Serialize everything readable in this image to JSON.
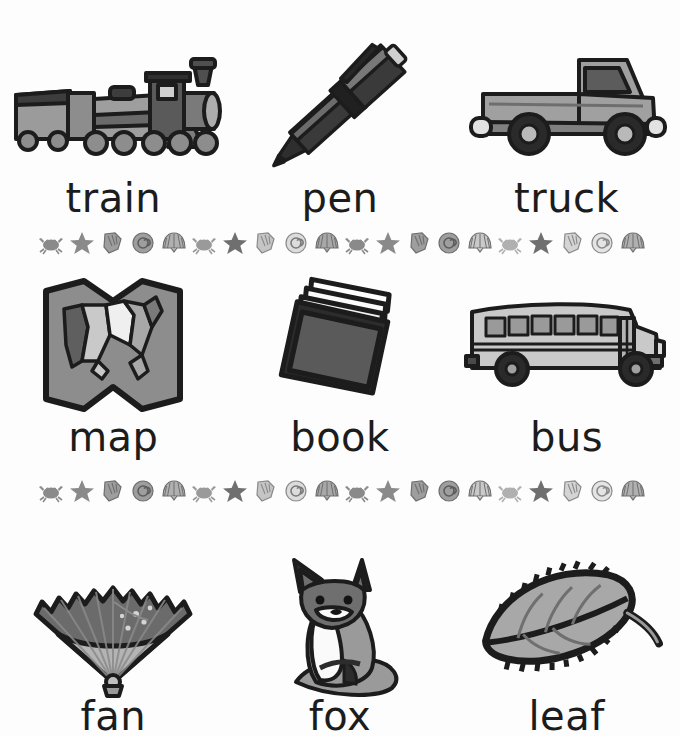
{
  "page": {
    "background_color": "#fdfdfd",
    "text_color": "#1c1c1c",
    "width": 680,
    "height": 736
  },
  "palette": {
    "ink": "#1c1c1c",
    "dark_gray": "#4a4a4a",
    "mid_gray": "#7d7d7d",
    "light_gray": "#b4b4b4",
    "pale_gray": "#d5d5d5",
    "near_white": "#efefef",
    "shell_gray": "#9b9b9b",
    "shell_light": "#c9c9c9"
  },
  "rows": [
    {
      "row_index": 1,
      "cards": [
        {
          "label": "train",
          "icon": "train-icon"
        },
        {
          "label": "pen",
          "icon": "pen-icon"
        },
        {
          "label": "truck",
          "icon": "truck-icon"
        }
      ]
    },
    {
      "row_index": 2,
      "cards": [
        {
          "label": "map",
          "icon": "map-icon"
        },
        {
          "label": "book",
          "icon": "book-icon"
        },
        {
          "label": "bus",
          "icon": "bus-icon"
        }
      ]
    },
    {
      "row_index": 3,
      "cards": [
        {
          "label": "fan",
          "icon": "fan-icon"
        },
        {
          "label": "fox",
          "icon": "fox-icon"
        },
        {
          "label": "leaf",
          "icon": "leaf-icon"
        }
      ]
    }
  ],
  "dividers": [
    {
      "divider_index": 1,
      "pattern": [
        "crab-icon",
        "starfish-icon",
        "conch-shell-icon",
        "spiral-shell-icon",
        "scallop-shell-icon"
      ],
      "repeat_count": 4,
      "total_icons": 20
    },
    {
      "divider_index": 2,
      "pattern": [
        "crab-icon",
        "starfish-icon",
        "conch-shell-icon",
        "spiral-shell-icon",
        "scallop-shell-icon"
      ],
      "repeat_count": 4,
      "total_icons": 20
    }
  ]
}
